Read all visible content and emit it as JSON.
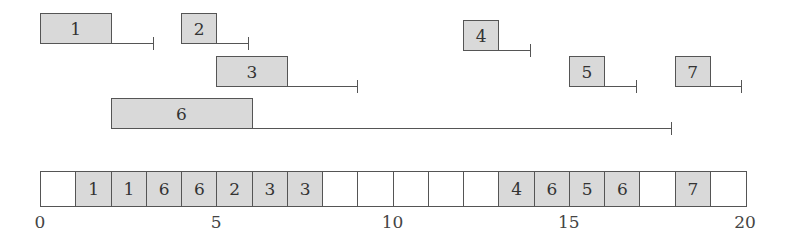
{
  "diagram": {
    "type": "scheduling-timeline",
    "jobs": [
      {
        "id": "1",
        "label": "1",
        "release": 0,
        "processing": 2,
        "deadline": 3.2,
        "row_y": 13
      },
      {
        "id": "2",
        "label": "2",
        "release": 4,
        "processing": 1,
        "deadline": 5.9,
        "row_y": 13
      },
      {
        "id": "3",
        "label": "3",
        "release": 5,
        "processing": 2,
        "deadline": 9.0,
        "row_y": 56
      },
      {
        "id": "4",
        "label": "4",
        "release": 12,
        "processing": 1,
        "deadline": 13.9,
        "row_y": 20
      },
      {
        "id": "5",
        "label": "5",
        "release": 15,
        "processing": 1,
        "deadline": 16.9,
        "row_y": 56
      },
      {
        "id": "6",
        "label": "6",
        "release": 2,
        "processing": 4,
        "deadline": 17.9,
        "row_y": 98
      },
      {
        "id": "7",
        "label": "7",
        "release": 18,
        "processing": 1,
        "deadline": 19.9,
        "row_y": 56
      }
    ],
    "schedule": [
      "",
      "1",
      "1",
      "6",
      "6",
      "2",
      "3",
      "3",
      "",
      "",
      "",
      "",
      "",
      "4",
      "6",
      "5",
      "6",
      "",
      "7",
      ""
    ],
    "axis": {
      "min": 0,
      "max": 20,
      "ticks": [
        "0",
        "5",
        "10",
        "15",
        "20"
      ]
    },
    "colors": {
      "box_fill": "#d9d9d9",
      "stroke": "#555555",
      "empty_fill": "#ffffff"
    }
  }
}
